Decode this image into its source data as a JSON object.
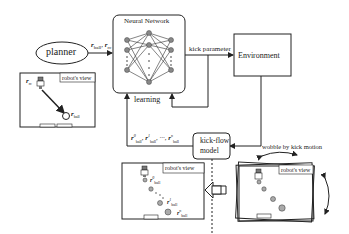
{
  "nodes": {
    "planner": {
      "label": "planner"
    },
    "neural_network": {
      "title": "Neural Network"
    },
    "environment": {
      "label": "Environment"
    },
    "kick_flow_model": {
      "line1": "kick-flow",
      "line2": "model"
    }
  },
  "edges": {
    "planner_to_nn": {
      "label": "r_ball, r_rc"
    },
    "nn_to_env": {
      "label": "kick parameter"
    },
    "learning": {
      "label": "learning"
    },
    "kickflow_to_nn": {
      "label": "r⁰_ball, r¹_ball, ..., rⁿ_ball"
    },
    "wobble": {
      "label": "wobble by kick motion"
    }
  },
  "views": {
    "top_left": {
      "caption": "robot's view",
      "robot_label": "r_rc",
      "ball_label": "r_ball"
    },
    "bottom_left": {
      "caption": "robot's view",
      "ball_labels": [
        "r⁰_ball",
        "r¹_ball",
        "rⁿ_ball"
      ]
    },
    "right": {
      "caption": "robot's view"
    }
  },
  "colors": {
    "stroke": "#222222",
    "node_fill": "#888888",
    "ball_fill": "#aaaaaa"
  }
}
